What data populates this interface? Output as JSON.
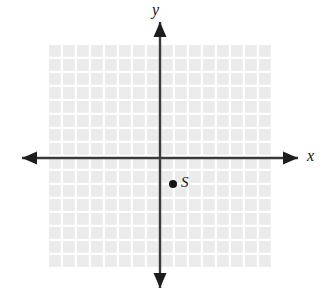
{
  "figure": {
    "kind": "cartesian-coordinate-plane",
    "background_color": "#ffffff"
  },
  "axes": {
    "x_label": "x",
    "y_label": "y",
    "line_color": "#3a3a3a",
    "arrow_color": "#1d1d1d",
    "x_axis": {
      "y": 158,
      "x_start": 22,
      "x_end": 298,
      "arrows": [
        "left",
        "right"
      ]
    },
    "y_axis": {
      "x": 160,
      "y_start": 22,
      "y_end": 288,
      "arrows": [
        "up",
        "down"
      ]
    }
  },
  "grid": {
    "color": "#ebebeb",
    "line_color": "#ffffff",
    "cell_size": 14,
    "left": 49,
    "top": 45,
    "columns": 16,
    "rows": 16
  },
  "points": [
    {
      "label": "S",
      "dot_color": "#141414",
      "dot_x": 173,
      "dot_y": 184,
      "grid_x": 1,
      "grid_y": -2
    }
  ]
}
